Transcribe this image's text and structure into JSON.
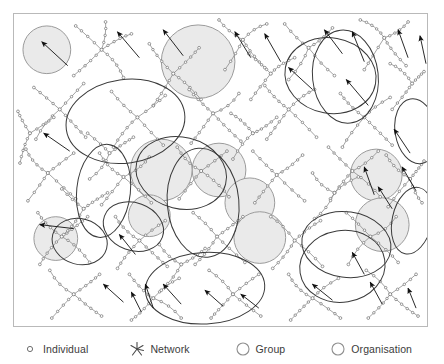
{
  "figure": {
    "frame": {
      "stroke": "#b9b9b9"
    },
    "colors": {
      "background": "#ffffff",
      "link": "#8b8b8b",
      "node": "#6f6f6f",
      "group_fill": "#eaeaea",
      "group_stroke": "#9a9a9a",
      "organisation_stroke": "#3a3a3a",
      "arrow": "#111111",
      "legend_text": "#3b3b3b",
      "frame_stroke": "#b9b9b9"
    }
  },
  "legend": {
    "items": [
      {
        "icon": "individual-circle-icon",
        "label": "Individual"
      },
      {
        "icon": "network-starburst-icon",
        "label": "Network"
      },
      {
        "icon": "group-circle-icon",
        "label": "Group"
      },
      {
        "icon": "organisation-circle-icon",
        "label": "Organisation"
      },
      {
        "icon": "movement-square-icon",
        "label": "Movement"
      }
    ]
  },
  "chart_data": {
    "type": "diagram",
    "subtitle": "",
    "xlabel": "",
    "ylabel": "",
    "legend_position": "bottom",
    "grid": false,
    "viewbox": [
      0,
      0,
      415,
      314
    ],
    "entity_counts": {
      "groups": 10,
      "organisations": 13,
      "networks": 34,
      "movements": 28
    },
    "groups": [
      {
        "cx": 33,
        "cy": 36,
        "r": 24
      },
      {
        "cx": 185,
        "cy": 48,
        "r": 37
      },
      {
        "cx": 206,
        "cy": 157,
        "r": 27
      },
      {
        "cx": 148,
        "cy": 157,
        "r": 31
      },
      {
        "cx": 237,
        "cy": 190,
        "r": 25
      },
      {
        "cx": 136,
        "cy": 203,
        "r": 21
      },
      {
        "cx": 247,
        "cy": 225,
        "r": 26
      },
      {
        "cx": 364,
        "cy": 162,
        "r": 26
      },
      {
        "cx": 42,
        "cy": 226,
        "r": 22
      },
      {
        "cx": 370,
        "cy": 212,
        "r": 27
      }
    ],
    "organisations": [
      {
        "cx": 112,
        "cy": 108,
        "rx": 60,
        "ry": 42,
        "rot": -8
      },
      {
        "cx": 90,
        "cy": 178,
        "rx": 27,
        "ry": 47,
        "rot": 6
      },
      {
        "cx": 168,
        "cy": 160,
        "rx": 46,
        "ry": 36,
        "rot": 14
      },
      {
        "cx": 190,
        "cy": 190,
        "rx": 36,
        "ry": 55,
        "rot": -5
      },
      {
        "cx": 120,
        "cy": 214,
        "rx": 31,
        "ry": 24,
        "rot": 20
      },
      {
        "cx": 318,
        "cy": 62,
        "rx": 46,
        "ry": 38,
        "rot": 10
      },
      {
        "cx": 333,
        "cy": 63,
        "rx": 33,
        "ry": 47,
        "rot": -6
      },
      {
        "cx": 192,
        "cy": 276,
        "rx": 60,
        "ry": 36,
        "rot": -3
      },
      {
        "cx": 334,
        "cy": 232,
        "rx": 45,
        "ry": 33,
        "rot": 8
      },
      {
        "cx": 330,
        "cy": 254,
        "rx": 43,
        "ry": 36,
        "rot": -9
      },
      {
        "cx": 400,
        "cy": 208,
        "rx": 20,
        "ry": 34,
        "rot": 12
      },
      {
        "cx": 404,
        "cy": 118,
        "rx": 21,
        "ry": 33,
        "rot": -10
      },
      {
        "cx": 66,
        "cy": 229,
        "rx": 28,
        "ry": 23,
        "rot": 15
      }
    ],
    "networks": [
      {
        "hub": [
          88,
          36
        ],
        "spokes": [
          [
            62,
            12
          ],
          [
            118,
            20
          ],
          [
            60,
            62
          ],
          [
            110,
            64
          ],
          [
            92,
            8
          ]
        ]
      },
      {
        "hub": [
          160,
          60
        ],
        "spokes": [
          [
            136,
            30
          ],
          [
            186,
            34
          ],
          [
            140,
            92
          ],
          [
            188,
            86
          ]
        ]
      },
      {
        "hub": [
          230,
          26
        ],
        "spokes": [
          [
            206,
            6
          ],
          [
            254,
            10
          ],
          [
            212,
            56
          ],
          [
            252,
            54
          ]
        ]
      },
      {
        "hub": [
          296,
          34
        ],
        "spokes": [
          [
            272,
            10
          ],
          [
            320,
            14
          ],
          [
            276,
            66
          ],
          [
            322,
            62
          ]
        ]
      },
      {
        "hub": [
          372,
          24
        ],
        "spokes": [
          [
            348,
            6
          ],
          [
            396,
            8
          ],
          [
            352,
            56
          ],
          [
            394,
            52
          ]
        ]
      },
      {
        "hub": [
          46,
          96
        ],
        "spokes": [
          [
            20,
            74
          ],
          [
            70,
            70
          ],
          [
            22,
            126
          ],
          [
            72,
            124
          ]
        ]
      },
      {
        "hub": [
          124,
          104
        ],
        "spokes": [
          [
            98,
            78
          ],
          [
            152,
            82
          ],
          [
            100,
            134
          ],
          [
            150,
            132
          ]
        ]
      },
      {
        "hub": [
          200,
          100
        ],
        "spokes": [
          [
            176,
            76
          ],
          [
            226,
            80
          ],
          [
            178,
            130
          ],
          [
            228,
            128
          ]
        ]
      },
      {
        "hub": [
          276,
          96
        ],
        "spokes": [
          [
            252,
            72
          ],
          [
            302,
            76
          ],
          [
            254,
            126
          ],
          [
            304,
            124
          ]
        ]
      },
      {
        "hub": [
          352,
          104
        ],
        "spokes": [
          [
            328,
            80
          ],
          [
            378,
            84
          ],
          [
            330,
            134
          ],
          [
            380,
            132
          ]
        ]
      },
      {
        "hub": [
          34,
          160
        ],
        "spokes": [
          [
            12,
            136
          ],
          [
            60,
            140
          ],
          [
            14,
            188
          ],
          [
            62,
            186
          ]
        ]
      },
      {
        "hub": [
          110,
          164
        ],
        "spokes": [
          [
            86,
            140
          ],
          [
            136,
            144
          ],
          [
            88,
            192
          ],
          [
            138,
            190
          ]
        ]
      },
      {
        "hub": [
          188,
          158
        ],
        "spokes": [
          [
            164,
            134
          ],
          [
            214,
            138
          ],
          [
            166,
            186
          ],
          [
            216,
            184
          ]
        ]
      },
      {
        "hub": [
          264,
          162
        ],
        "spokes": [
          [
            240,
            138
          ],
          [
            290,
            142
          ],
          [
            242,
            190
          ],
          [
            292,
            188
          ]
        ]
      },
      {
        "hub": [
          340,
          158
        ],
        "spokes": [
          [
            316,
            134
          ],
          [
            366,
            138
          ],
          [
            318,
            186
          ],
          [
            368,
            184
          ]
        ]
      },
      {
        "hub": [
          398,
          166
        ],
        "spokes": [
          [
            374,
            142
          ],
          [
            412,
            148
          ],
          [
            376,
            194
          ],
          [
            410,
            190
          ]
        ]
      },
      {
        "hub": [
          48,
          224
        ],
        "spokes": [
          [
            24,
            200
          ],
          [
            74,
            204
          ],
          [
            26,
            252
          ],
          [
            76,
            250
          ]
        ]
      },
      {
        "hub": [
          126,
          228
        ],
        "spokes": [
          [
            102,
            204
          ],
          [
            152,
            208
          ],
          [
            104,
            256
          ],
          [
            154,
            254
          ]
        ]
      },
      {
        "hub": [
          204,
          224
        ],
        "spokes": [
          [
            180,
            200
          ],
          [
            230,
            204
          ],
          [
            182,
            252
          ],
          [
            232,
            250
          ]
        ]
      },
      {
        "hub": [
          282,
          228
        ],
        "spokes": [
          [
            258,
            204
          ],
          [
            308,
            208
          ],
          [
            260,
            256
          ],
          [
            310,
            254
          ]
        ]
      },
      {
        "hub": [
          358,
          224
        ],
        "spokes": [
          [
            334,
            200
          ],
          [
            384,
            204
          ],
          [
            336,
            252
          ],
          [
            386,
            250
          ]
        ]
      },
      {
        "hub": [
          60,
          282
        ],
        "spokes": [
          [
            36,
            258
          ],
          [
            86,
            262
          ],
          [
            38,
            306
          ],
          [
            88,
            304
          ]
        ]
      },
      {
        "hub": [
          140,
          286
        ],
        "spokes": [
          [
            116,
            262
          ],
          [
            166,
            266
          ],
          [
            118,
            308
          ],
          [
            168,
            306
          ]
        ]
      },
      {
        "hub": [
          220,
          282
        ],
        "spokes": [
          [
            196,
            258
          ],
          [
            246,
            262
          ],
          [
            198,
            306
          ],
          [
            248,
            304
          ]
        ]
      },
      {
        "hub": [
          300,
          286
        ],
        "spokes": [
          [
            276,
            262
          ],
          [
            326,
            266
          ],
          [
            278,
            308
          ],
          [
            328,
            306
          ]
        ]
      },
      {
        "hub": [
          378,
          282
        ],
        "spokes": [
          [
            354,
            258
          ],
          [
            404,
            262
          ],
          [
            356,
            306
          ],
          [
            406,
            304
          ]
        ]
      },
      {
        "hub": [
          96,
          140
        ],
        "spokes": [
          [
            74,
            120
          ],
          [
            120,
            124
          ],
          [
            76,
            166
          ]
        ]
      },
      {
        "hub": [
          240,
          120
        ],
        "spokes": [
          [
            218,
            100
          ],
          [
            264,
            104
          ],
          [
            220,
            146
          ]
        ]
      },
      {
        "hub": [
          168,
          252
        ],
        "spokes": [
          [
            146,
            232
          ],
          [
            192,
            236
          ],
          [
            148,
            278
          ]
        ]
      },
      {
        "hub": [
          322,
          180
        ],
        "spokes": [
          [
            300,
            160
          ],
          [
            346,
            164
          ],
          [
            302,
            206
          ]
        ]
      },
      {
        "hub": [
          70,
          196
        ],
        "spokes": [
          [
            48,
            176
          ],
          [
            94,
            180
          ],
          [
            50,
            222
          ]
        ]
      },
      {
        "hub": [
          258,
          60
        ],
        "spokes": [
          [
            236,
            40
          ],
          [
            282,
            44
          ],
          [
            238,
            86
          ]
        ]
      },
      {
        "hub": [
          400,
          70
        ],
        "spokes": [
          [
            378,
            50
          ],
          [
            412,
            58
          ],
          [
            380,
            96
          ]
        ]
      },
      {
        "hub": [
          16,
          120
        ],
        "spokes": [
          [
            4,
            98
          ],
          [
            40,
            104
          ],
          [
            6,
            150
          ]
        ]
      }
    ],
    "movement_arrows": [
      {
        "from": [
          54,
          52
        ],
        "to": [
          28,
          28
        ]
      },
      {
        "from": [
          126,
          44
        ],
        "to": [
          104,
          18
        ]
      },
      {
        "from": [
          170,
          42
        ],
        "to": [
          150,
          16
        ]
      },
      {
        "from": [
          238,
          44
        ],
        "to": [
          222,
          18
        ]
      },
      {
        "from": [
          268,
          48
        ],
        "to": [
          252,
          20
        ]
      },
      {
        "from": [
          330,
          40
        ],
        "to": [
          312,
          16
        ]
      },
      {
        "from": [
          352,
          48
        ],
        "to": [
          340,
          18
        ]
      },
      {
        "from": [
          396,
          44
        ],
        "to": [
          386,
          16
        ]
      },
      {
        "from": [
          414,
          50
        ],
        "to": [
          408,
          22
        ]
      },
      {
        "from": [
          56,
          138
        ],
        "to": [
          30,
          120
        ]
      },
      {
        "from": [
          60,
          216
        ],
        "to": [
          26,
          212
        ]
      },
      {
        "from": [
          300,
          76
        ],
        "to": [
          276,
          54
        ]
      },
      {
        "from": [
          356,
          92
        ],
        "to": [
          334,
          66
        ]
      },
      {
        "from": [
          398,
          140
        ],
        "to": [
          382,
          116
        ]
      },
      {
        "from": [
          404,
          178
        ],
        "to": [
          390,
          154
        ]
      },
      {
        "from": [
          362,
          182
        ],
        "to": [
          352,
          154
        ]
      },
      {
        "from": [
          380,
          196
        ],
        "to": [
          366,
          174
        ]
      },
      {
        "from": [
          122,
          242
        ],
        "to": [
          106,
          222
        ]
      },
      {
        "from": [
          110,
          290
        ],
        "to": [
          90,
          272
        ]
      },
      {
        "from": [
          140,
          296
        ],
        "to": [
          132,
          272
        ]
      },
      {
        "from": [
          128,
          300
        ],
        "to": [
          118,
          280
        ]
      },
      {
        "from": [
          168,
          292
        ],
        "to": [
          150,
          272
        ]
      },
      {
        "from": [
          210,
          294
        ],
        "to": [
          192,
          278
        ]
      },
      {
        "from": [
          246,
          296
        ],
        "to": [
          228,
          282
        ]
      },
      {
        "from": [
          320,
          288
        ],
        "to": [
          300,
          272
        ]
      },
      {
        "from": [
          352,
          262
        ],
        "to": [
          340,
          240
        ]
      },
      {
        "from": [
          370,
          292
        ],
        "to": [
          358,
          270
        ]
      },
      {
        "from": [
          404,
          296
        ],
        "to": [
          396,
          276
        ]
      }
    ]
  }
}
